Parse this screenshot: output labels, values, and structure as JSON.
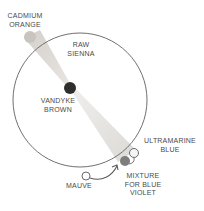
{
  "diagram": {
    "type": "color-wheel-complement",
    "colors": {
      "line": "#707070",
      "cadmium_orange": "#c9c4c0",
      "raw_sienna_wedge": "#d9d6d2",
      "vandyke_brown": "#2e2e2e",
      "mixture": "#7d7d7d",
      "ring": "#6a6a6a",
      "text": "#4a4a4a"
    }
  },
  "labels": {
    "cadmium_orange": [
      "CADMIUM",
      "ORANGE"
    ],
    "raw_sienna": [
      "RAW",
      "SIENNA"
    ],
    "vandyke_brown": [
      "VANDYKE",
      "BROWN"
    ],
    "ultramarine_blue": [
      "ULTRAMARINE",
      "BLUE"
    ],
    "mixture": [
      "MIXTURE",
      "FOR BLUE",
      "VIOLET"
    ],
    "mauve": [
      "MAUVE"
    ]
  }
}
